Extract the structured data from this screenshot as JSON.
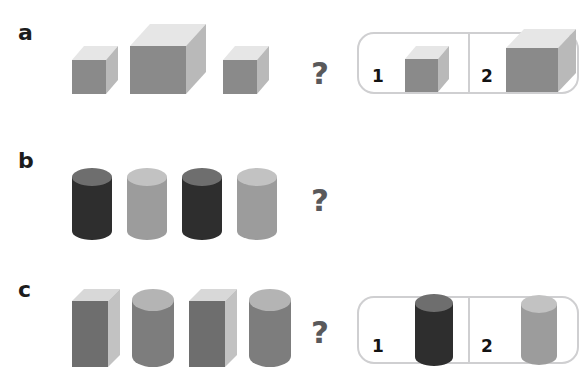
{
  "page": {
    "background_color": "#ffffff",
    "question_glyph": "?"
  },
  "palette": {
    "dark_front": "#2e2e2e",
    "dark_side": "#474747",
    "dark_top": "#6e6e6e",
    "mid_front": "#8a8a8a",
    "mid_side": "#b9b9b9",
    "mid_top": "#e6e6e6",
    "light_front": "#9c9c9c",
    "light_side": "#c2c2c2",
    "light_top": "#d2d2d2",
    "panel_border": "#cfcfd1",
    "text": "#1c1c1c",
    "question_color": "#59595b"
  },
  "rows": [
    {
      "id": "a",
      "label": "a",
      "question": "?",
      "sequence": [
        {
          "name": "cube-small",
          "shape": "cube",
          "tone": "mid",
          "size": "small"
        },
        {
          "name": "cube-large",
          "shape": "cube",
          "tone": "mid",
          "size": "large"
        },
        {
          "name": "cube-small",
          "shape": "cube",
          "tone": "mid",
          "size": "small"
        }
      ],
      "options": [
        {
          "number": "1",
          "name": "cube-small",
          "shape": "cube",
          "tone": "mid",
          "size": "small"
        },
        {
          "number": "2",
          "name": "cube-large",
          "shape": "cube",
          "tone": "mid",
          "size": "large"
        }
      ]
    },
    {
      "id": "b",
      "label": "b",
      "question": "?",
      "sequence": [
        {
          "name": "cylinder-dark",
          "shape": "cylinder",
          "tone": "dark",
          "size": "medium"
        },
        {
          "name": "cylinder-light",
          "shape": "cylinder",
          "tone": "light",
          "size": "medium"
        },
        {
          "name": "cylinder-dark",
          "shape": "cylinder",
          "tone": "dark",
          "size": "medium"
        },
        {
          "name": "cylinder-light",
          "shape": "cylinder",
          "tone": "light",
          "size": "medium"
        }
      ],
      "options": [
        {
          "number": "1",
          "name": "cylinder-dark",
          "shape": "cylinder",
          "tone": "dark",
          "size": "medium"
        },
        {
          "number": "2",
          "name": "cylinder-light",
          "shape": "cylinder",
          "tone": "light",
          "size": "medium"
        }
      ]
    },
    {
      "id": "c",
      "label": "c",
      "question": "?",
      "sequence": [
        {
          "name": "box-tall",
          "shape": "box",
          "tone": "mid",
          "size": "tall"
        },
        {
          "name": "cylinder-tall",
          "shape": "cylinder",
          "tone": "mid",
          "size": "tall"
        },
        {
          "name": "box-tall",
          "shape": "box",
          "tone": "mid",
          "size": "tall"
        },
        {
          "name": "cylinder-tall",
          "shape": "cylinder",
          "tone": "mid",
          "size": "tall"
        }
      ],
      "options": [
        {
          "number": "1",
          "name": "cylinder-tall",
          "shape": "cylinder",
          "tone": "mid",
          "size": "tall"
        },
        {
          "number": "2",
          "name": "box-tall",
          "shape": "box",
          "tone": "mid",
          "size": "tall"
        }
      ]
    }
  ]
}
